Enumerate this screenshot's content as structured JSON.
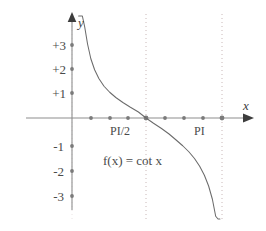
{
  "chart_data": {
    "type": "line",
    "title": "",
    "subtitle": "",
    "function_label": "f(x) = cot x",
    "xlabel": "x",
    "ylabel": "y",
    "grid": false,
    "legend": "none",
    "xlim": [
      -0.45,
      4.05
    ],
    "ylim": [
      -3.9,
      3.9
    ],
    "x_tick_labels": [
      "PI/2",
      "PI"
    ],
    "x_tick_label_values": [
      1.5708,
      3.1416
    ],
    "y_tick_labels": [
      "+3",
      "+2",
      "+1",
      "-1",
      "-2",
      "-3"
    ],
    "y_tick_values": [
      3,
      2,
      1,
      -1,
      -2,
      -3
    ],
    "x_tick_dot_values": [
      0.3927,
      0.7854,
      1.1781,
      1.5708,
      1.9635,
      2.3562,
      2.7489,
      3.1416
    ],
    "asymptotes": [
      0,
      1.5708,
      3.1416
    ],
    "asymptote_style": "dotted",
    "zero_crossings": [
      1.5708
    ],
    "series": [
      {
        "name": "cot x",
        "x": [
          0.14,
          0.18,
          0.22,
          0.27,
          0.33,
          0.4,
          0.48,
          0.57,
          0.68,
          0.8,
          0.93,
          1.08,
          1.24,
          1.41,
          1.5708,
          1.73,
          1.9,
          2.06,
          2.21,
          2.35,
          2.48,
          2.6,
          2.71,
          2.81,
          2.9,
          2.98,
          3.05,
          3.1,
          3.14
        ],
        "y": [
          7.09,
          5.5,
          4.49,
          3.64,
          2.96,
          2.37,
          1.93,
          1.58,
          1.27,
          1.03,
          0.82,
          0.62,
          0.43,
          0.24,
          0.0,
          -0.21,
          -0.42,
          -0.64,
          -0.88,
          -1.11,
          -1.35,
          -1.62,
          -1.93,
          -2.29,
          -2.72,
          -3.25,
          -3.93,
          -4.68,
          -7.09
        ]
      }
    ]
  },
  "labels": {
    "x_axis_name": "x",
    "y_axis_name": "y",
    "function_text": "f(x) = cot x",
    "y_ticks": [
      "+3",
      "+2",
      "+1",
      "-1",
      "-2",
      "-3"
    ],
    "x_ticks": [
      "PI/2",
      "PI"
    ]
  },
  "colors": {
    "background": "#ffffff",
    "axis": "#8d8d8d",
    "curve": "#6b6b6b",
    "text": "#4a4a4a",
    "asymptote": "#c9b8b8",
    "tick_dot": "#7a7a7a",
    "arrow": "#3d3d3d"
  }
}
